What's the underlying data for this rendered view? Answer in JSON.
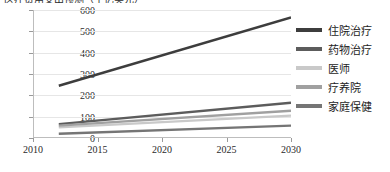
{
  "title": {
    "text": "医疗费用支出预测（十亿美元）",
    "clipped": true
  },
  "legend": {
    "position": "right",
    "items": [
      {
        "label": "住院治疗",
        "color": "#3d3d3d"
      },
      {
        "label": "药物治疗",
        "color": "#5c5c5c"
      },
      {
        "label": "医师",
        "color": "#c9c9c9"
      },
      {
        "label": "疗养院",
        "color": "#a0a0a0"
      },
      {
        "label": "家庭保健",
        "color": "#757575"
      }
    ]
  },
  "axes": {
    "x_ticks": [
      "2010",
      "2015",
      "2020",
      "2025",
      "2030"
    ],
    "y_ticks": [
      "0",
      "100",
      "200",
      "300",
      "400",
      "500",
      "600"
    ]
  },
  "chart_data": {
    "type": "line",
    "title": "医疗费用支出预测（十亿美元）",
    "xlabel": "",
    "ylabel": "",
    "x": [
      2012,
      2030
    ],
    "xlim": [
      2010,
      2030
    ],
    "ylim": [
      0,
      600
    ],
    "grid": true,
    "legend_position": "right",
    "xticks": [
      2010,
      2015,
      2020,
      2025,
      2030
    ],
    "yticks": [
      0,
      100,
      200,
      300,
      400,
      500,
      600
    ],
    "series": [
      {
        "name": "住院治疗",
        "color": "#3d3d3d",
        "values": [
          245,
          565
        ]
      },
      {
        "name": "药物治疗",
        "color": "#5c5c5c",
        "values": [
          65,
          165
        ]
      },
      {
        "name": "医师",
        "color": "#c9c9c9",
        "values": [
          50,
          105
        ]
      },
      {
        "name": "疗养院",
        "color": "#a0a0a0",
        "values": [
          58,
          128
        ]
      },
      {
        "name": "家庭保健",
        "color": "#757575",
        "values": [
          20,
          58
        ]
      }
    ]
  }
}
